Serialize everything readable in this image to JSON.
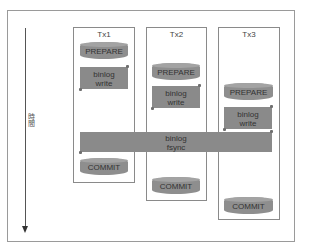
{
  "diagram": {
    "axis": {
      "label": "時間",
      "direction": "down"
    },
    "transactions": [
      {
        "title": "Tx1",
        "prepare": "PREPARE",
        "binlog_write": [
          "binlog",
          "write"
        ],
        "commit": "COMMIT"
      },
      {
        "title": "Tx2",
        "prepare": "PREPARE",
        "binlog_write": [
          "binlog",
          "write"
        ],
        "commit": "COMMIT"
      },
      {
        "title": "Tx3",
        "prepare": "PREPARE",
        "binlog_write": [
          "binlog",
          "write"
        ],
        "commit": "COMMIT"
      }
    ],
    "shared_step": {
      "line1": "binlog",
      "line2": "fsync"
    },
    "colors": {
      "shape_fill": "#8e8e8e",
      "border": "#8a8a8a",
      "text": "#333333"
    }
  }
}
